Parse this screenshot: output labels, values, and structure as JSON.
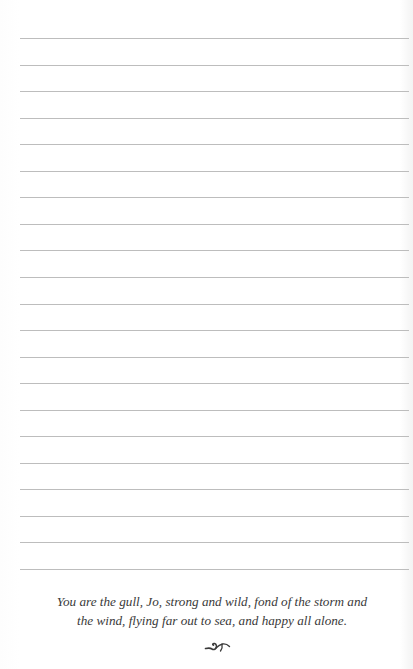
{
  "page": {
    "ruled_line_count": 21,
    "ruled_line_first_y": 38,
    "ruled_line_spacing": 26.55,
    "line_color": "#bdbdbd",
    "text_color": "#3a3a3a"
  },
  "quote": {
    "lines": [
      "You are the gull, Jo, strong and wild, fond of the storm and",
      "the wind, flying far out to sea, and happy all alone."
    ]
  },
  "ornament": {
    "icon": "flourish-ornament-icon"
  }
}
